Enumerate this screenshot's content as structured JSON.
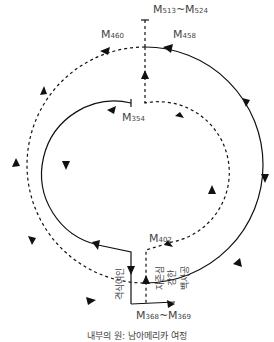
{
  "labels": {
    "top": {
      "prefix": "M",
      "start": "513",
      "sep": "~",
      "end": "524"
    },
    "m460": {
      "prefix": "M",
      "num": "460"
    },
    "m458": {
      "prefix": "M",
      "num": "458"
    },
    "m354": {
      "prefix": "M",
      "num": "354"
    },
    "m402": {
      "prefix": "M",
      "num": "402"
    },
    "bottom": {
      "prefix": "M",
      "start": "368",
      "sep": "~",
      "end": "369"
    }
  },
  "vertical_texts": {
    "left": "격식여인",
    "right_1": "자존심",
    "right_2": "강한",
    "right_3": "백사공"
  },
  "caption": "내부의 원: 남아메리카 여정",
  "colors": {
    "line": "#111111",
    "text": "#444444"
  }
}
